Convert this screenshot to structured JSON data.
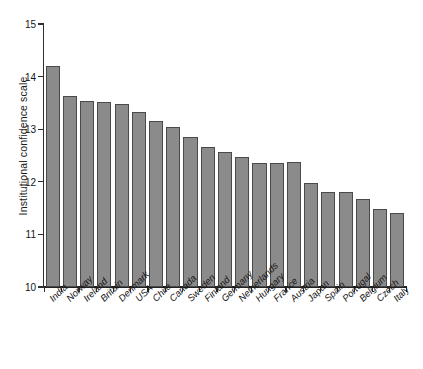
{
  "chart_data": {
    "type": "bar",
    "title": "",
    "subtitle": "",
    "xlabel": "",
    "ylabel": "Institutional confidence scale",
    "ylim": [
      10,
      15
    ],
    "yticks": [
      10,
      11,
      12,
      13,
      14,
      15
    ],
    "ytick_labels": [
      "10",
      "11",
      "12",
      "13",
      "14",
      "15"
    ],
    "grid": false,
    "legend": null,
    "bar_color": "#8b8b8b",
    "bar_edge_color": "#4a4a4a",
    "axis_color": "#222222",
    "background": "#ffffff",
    "categories": [
      "India",
      "Norway",
      "Ireland",
      "Britain",
      "Denmark",
      "USA",
      "Chile",
      "Canada",
      "Sweden",
      "Finland",
      "Germany",
      "Netherlands",
      "Hungary",
      "France",
      "Austria",
      "Japan",
      "Spain",
      "Portugal",
      "Belgium",
      "Czech",
      "Italy"
    ],
    "values": [
      14.21,
      13.63,
      13.53,
      13.52,
      13.48,
      13.33,
      13.15,
      13.05,
      12.85,
      12.66,
      12.56,
      12.48,
      12.36,
      12.36,
      12.37,
      11.97,
      11.8,
      11.8,
      11.68,
      11.49,
      11.4
    ]
  }
}
